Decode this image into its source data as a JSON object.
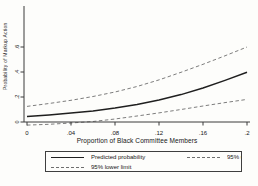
{
  "figure": {
    "background": "#fdfdfb",
    "axis_color": "#3a3a3a",
    "text_color": "#151515"
  },
  "chart_data": {
    "type": "line",
    "title": "",
    "xlabel": "Proportion of Black Committee Members",
    "ylabel": "Probability of Markup Action",
    "xlim": [
      0,
      0.205
    ],
    "ylim": [
      -0.04,
      0.93
    ],
    "grid": false,
    "x": [
      0,
      0.02,
      0.04,
      0.06,
      0.08,
      0.1,
      0.12,
      0.14,
      0.16,
      0.18,
      0.2
    ],
    "series": [
      {
        "name": "Predicted probability",
        "style": "solid",
        "color": "#1f1f1f",
        "width": 1.5,
        "values": [
          0.045,
          0.057,
          0.071,
          0.089,
          0.112,
          0.141,
          0.176,
          0.219,
          0.272,
          0.333,
          0.398
        ]
      },
      {
        "name": "95% upper limit",
        "style": "dashed",
        "color": "#6e6e6e",
        "width": 0.9,
        "values": [
          0.125,
          0.148,
          0.174,
          0.204,
          0.24,
          0.284,
          0.337,
          0.398,
          0.462,
          0.53,
          0.6
        ]
      },
      {
        "name": "95% lower limit",
        "style": "dashed",
        "color": "#6e6e6e",
        "width": 0.9,
        "values": [
          -0.025,
          -0.018,
          -0.008,
          0.004,
          0.024,
          0.048,
          0.073,
          0.1,
          0.128,
          0.155,
          0.181
        ]
      }
    ],
    "x_ticks": {
      "values": [
        0,
        0.04,
        0.08,
        0.12,
        0.16,
        0.2
      ],
      "labels": [
        "0",
        ".04",
        ".08",
        ".12",
        ".16",
        ".2"
      ]
    },
    "y_ticks": {
      "values": [
        0,
        0.2,
        0.4,
        0.6
      ],
      "labels": [
        "0",
        ".2",
        ".4",
        ".6"
      ],
      "label_angle": 90
    },
    "legend": {
      "position": "below",
      "border": true,
      "items": [
        {
          "label": "Predicted probability",
          "style": "solid"
        },
        {
          "label": "95% upper limit",
          "style": "dashed"
        },
        {
          "label": "95% lower limit",
          "style": "dashed"
        }
      ]
    }
  }
}
